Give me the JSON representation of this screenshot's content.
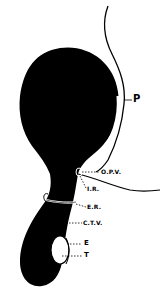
{
  "diagram": {
    "colors": {
      "body": "#000000",
      "background": "#ffffff",
      "line": "#000000"
    },
    "labels": {
      "p": "P",
      "opv": "O.P.V.",
      "ir": "I.R.",
      "er": "E.R.",
      "ctv": "C.T.V.",
      "e": "E",
      "t": "T"
    }
  }
}
